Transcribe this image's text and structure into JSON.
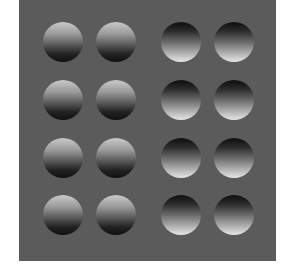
{
  "figure": {
    "background_color": "#5b5b5b",
    "grid": {
      "rows": 4,
      "columns": 4
    },
    "left_group": {
      "shading": "light-top",
      "appearance": "convex bumps",
      "columns": 2
    },
    "right_group": {
      "shading": "light-bottom",
      "appearance": "concave dimples",
      "columns": 2
    }
  }
}
